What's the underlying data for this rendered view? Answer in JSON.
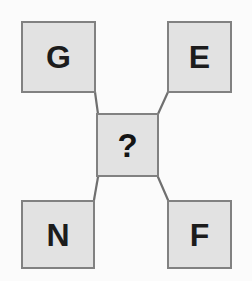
{
  "diagram": {
    "type": "node-link-puzzle",
    "background_color": "#fbfbfb",
    "node_fill_color": "#e2e2e2",
    "node_border_color": "#818181",
    "label_color": "#1c1c1c",
    "connector_color": "#6f6f6f",
    "nodes": [
      {
        "id": "g",
        "label": "G",
        "position": "top-left"
      },
      {
        "id": "e",
        "label": "E",
        "position": "top-right"
      },
      {
        "id": "center",
        "label": "?",
        "position": "center"
      },
      {
        "id": "n",
        "label": "N",
        "position": "bottom-left"
      },
      {
        "id": "f",
        "label": "F",
        "position": "bottom-right"
      }
    ],
    "connectors": [
      {
        "from": "g",
        "to": "center"
      },
      {
        "from": "e",
        "to": "center"
      },
      {
        "from": "n",
        "to": "center"
      },
      {
        "from": "f",
        "to": "center"
      }
    ]
  }
}
